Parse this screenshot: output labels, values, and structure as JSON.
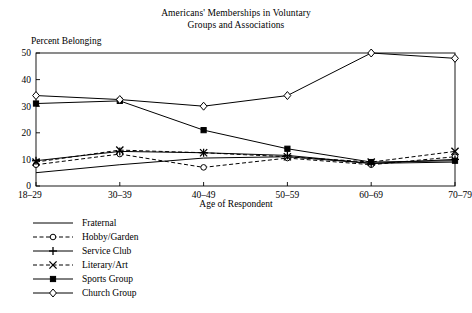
{
  "chart_data": {
    "type": "line",
    "title": "Americans' Memberships in Voluntary Groups and Associations",
    "title_line1": "Americans' Memberships in Voluntary",
    "title_line2": "Groups and Associations",
    "xlabel": "Age of Respondent",
    "ylabel": "Percent Belonging",
    "categories": [
      "18–29",
      "30–39",
      "40–49",
      "50–59",
      "60–69",
      "70–79"
    ],
    "ylim": [
      0,
      50
    ],
    "yticks": [
      0,
      10,
      20,
      30,
      40,
      50
    ],
    "ytick_labels": [
      "0",
      "10",
      "20",
      "30",
      "40",
      "50"
    ],
    "grid": false,
    "legend_position": "below-left",
    "series": [
      {
        "name": "Fraternal",
        "values": [
          5.0,
          8.0,
          10.5,
          11.0,
          8.5,
          9.0
        ],
        "marker": "none",
        "dash": "solid",
        "color": "#000000"
      },
      {
        "name": "Hobby/Garden",
        "values": [
          8.0,
          12.0,
          7.0,
          10.5,
          8.0,
          11.0
        ],
        "marker": "circle-open",
        "dash": "dashed",
        "color": "#000000"
      },
      {
        "name": "Service Club",
        "values": [
          9.5,
          13.0,
          12.5,
          11.5,
          8.5,
          10.0
        ],
        "marker": "plus",
        "dash": "solid",
        "color": "#000000"
      },
      {
        "name": "Literary/Art",
        "values": [
          9.0,
          13.5,
          12.5,
          11.0,
          9.0,
          13.0
        ],
        "marker": "x",
        "dash": "dashed",
        "color": "#000000"
      },
      {
        "name": "Sports Group",
        "values": [
          31.0,
          32.0,
          21.0,
          14.0,
          9.0,
          9.5
        ],
        "marker": "square-filled",
        "dash": "solid",
        "color": "#000000"
      },
      {
        "name": "Church Group",
        "values": [
          34.0,
          32.5,
          30.0,
          34.0,
          50.0,
          48.0
        ],
        "marker": "diamond-open",
        "dash": "solid",
        "color": "#000000"
      }
    ]
  },
  "axes": {
    "y_label_text": "Percent Belonging",
    "x_label_text": "Age of Respondent"
  }
}
